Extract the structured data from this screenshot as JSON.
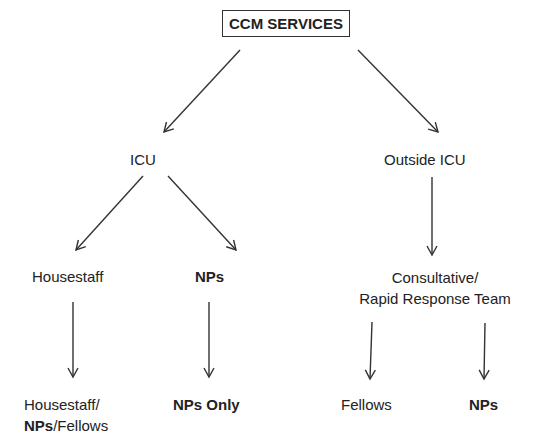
{
  "title": "CCM SERVICES",
  "nodes": {
    "root": "CCM SERVICES",
    "icu": "ICU",
    "outside_icu": "Outside ICU",
    "housestaff": "Housestaff",
    "nps": "NPs",
    "housestaff_combo_line1": "Housestaff/",
    "housestaff_combo_nps": "NPs",
    "housestaff_combo_fellows": "/Fellows",
    "nps_only": "NPs Only",
    "consultative_line1": "Consultative/",
    "consultative_line2": "Rapid Response Team",
    "fellows": "Fellows",
    "outside_nps": "NPs"
  },
  "edges": [
    [
      "root",
      "icu"
    ],
    [
      "root",
      "outside_icu"
    ],
    [
      "icu",
      "housestaff"
    ],
    [
      "icu",
      "nps"
    ],
    [
      "housestaff",
      "housestaff_combo"
    ],
    [
      "nps",
      "nps_only"
    ],
    [
      "outside_icu",
      "consultative"
    ],
    [
      "consultative",
      "fellows"
    ],
    [
      "consultative",
      "outside_nps"
    ]
  ]
}
